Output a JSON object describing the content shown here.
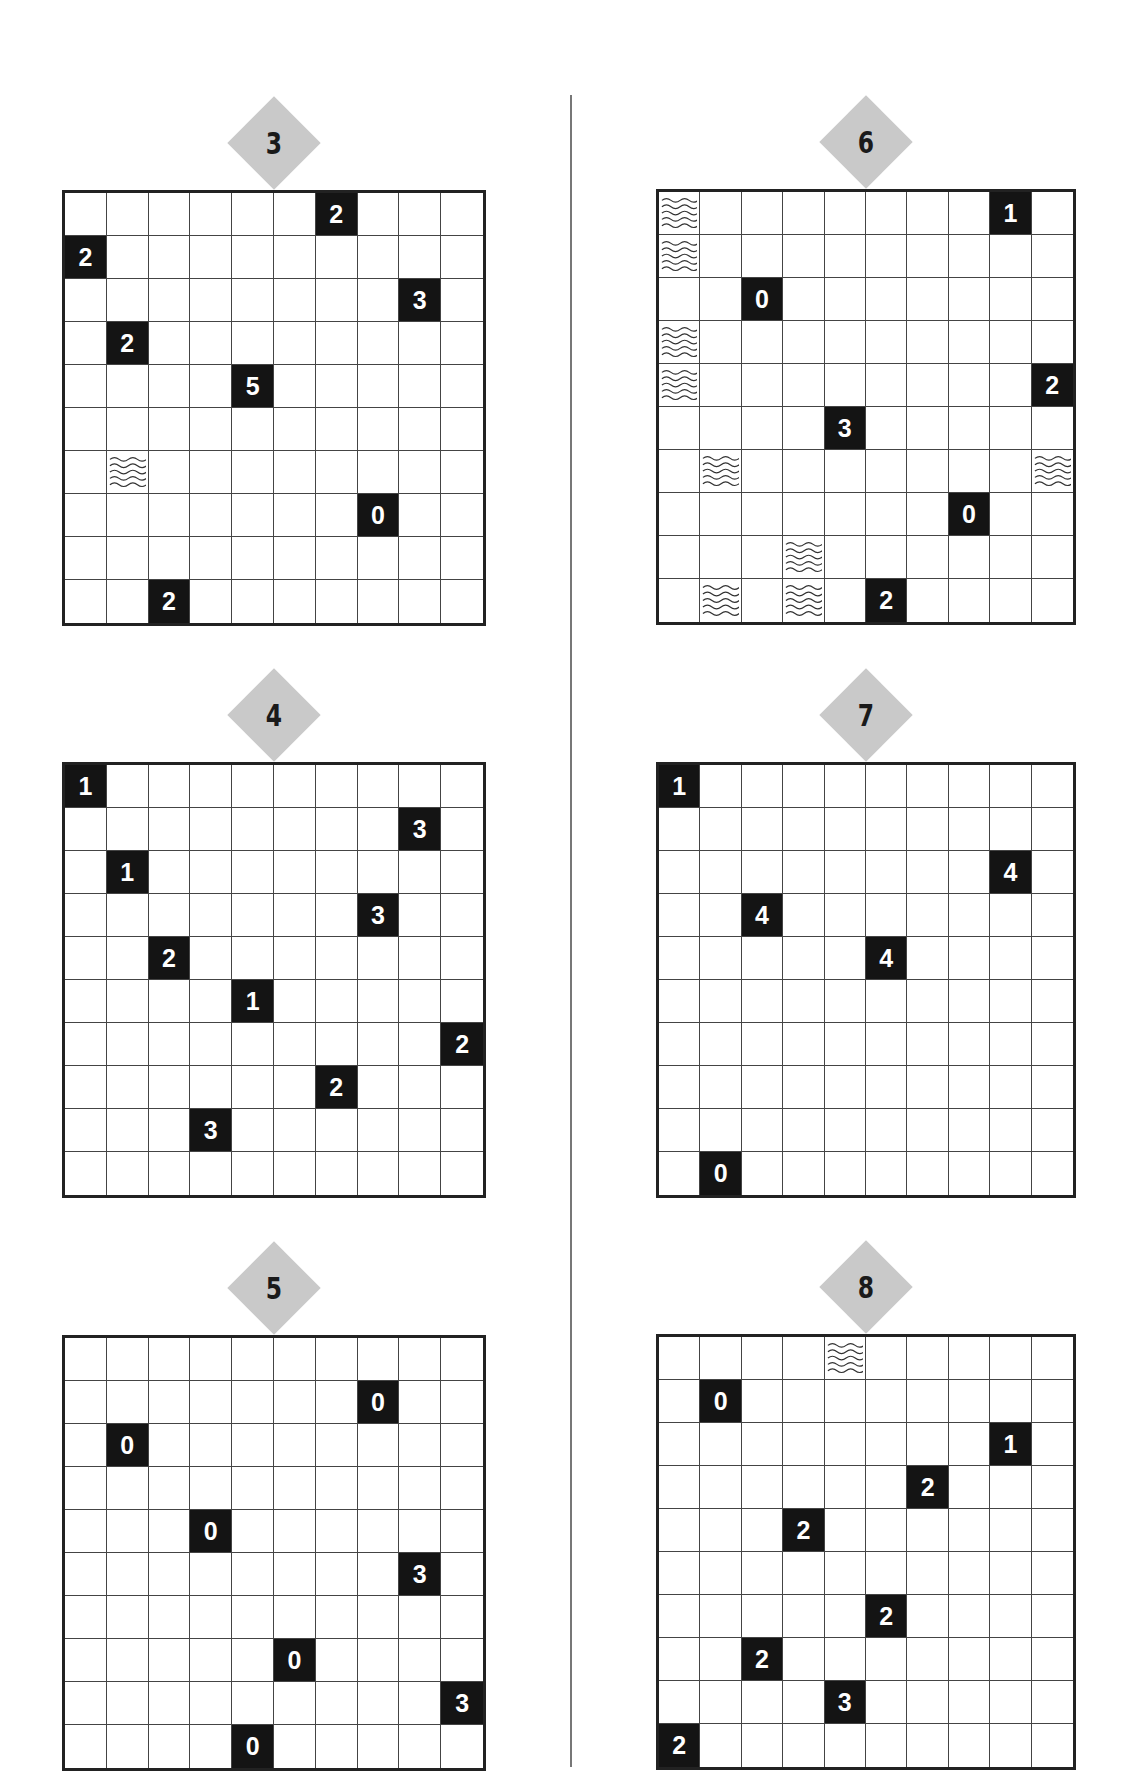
{
  "page": {
    "divider": true
  },
  "puzzles": [
    {
      "label": "3",
      "column": "left",
      "grid_x": 62,
      "grid_y": 190,
      "rows": 10,
      "cols": 10,
      "clues": [
        {
          "r": 0,
          "c": 6,
          "v": "2"
        },
        {
          "r": 1,
          "c": 0,
          "v": "2"
        },
        {
          "r": 2,
          "c": 8,
          "v": "3"
        },
        {
          "r": 3,
          "c": 1,
          "v": "2"
        },
        {
          "r": 4,
          "c": 4,
          "v": "5"
        },
        {
          "r": 7,
          "c": 7,
          "v": "0"
        },
        {
          "r": 9,
          "c": 2,
          "v": "2"
        }
      ],
      "water": [
        {
          "r": 6,
          "c": 1
        }
      ]
    },
    {
      "label": "4",
      "column": "left",
      "grid_x": 62,
      "grid_y": 762,
      "rows": 10,
      "cols": 10,
      "clues": [
        {
          "r": 0,
          "c": 0,
          "v": "1"
        },
        {
          "r": 1,
          "c": 8,
          "v": "3"
        },
        {
          "r": 2,
          "c": 1,
          "v": "1"
        },
        {
          "r": 3,
          "c": 7,
          "v": "3"
        },
        {
          "r": 4,
          "c": 2,
          "v": "2"
        },
        {
          "r": 5,
          "c": 4,
          "v": "1"
        },
        {
          "r": 6,
          "c": 9,
          "v": "2"
        },
        {
          "r": 7,
          "c": 6,
          "v": "2"
        },
        {
          "r": 8,
          "c": 3,
          "v": "3"
        }
      ],
      "water": []
    },
    {
      "label": "5",
      "column": "left",
      "grid_x": 62,
      "grid_y": 1335,
      "rows": 10,
      "cols": 10,
      "clues": [
        {
          "r": 1,
          "c": 7,
          "v": "0"
        },
        {
          "r": 2,
          "c": 1,
          "v": "0"
        },
        {
          "r": 4,
          "c": 3,
          "v": "0"
        },
        {
          "r": 5,
          "c": 8,
          "v": "3"
        },
        {
          "r": 7,
          "c": 5,
          "v": "0"
        },
        {
          "r": 8,
          "c": 9,
          "v": "3"
        },
        {
          "r": 9,
          "c": 4,
          "v": "0"
        }
      ],
      "water": []
    },
    {
      "label": "6",
      "column": "right",
      "grid_x": 656,
      "grid_y": 189,
      "rows": 10,
      "cols": 10,
      "clues": [
        {
          "r": 0,
          "c": 8,
          "v": "1"
        },
        {
          "r": 2,
          "c": 2,
          "v": "0"
        },
        {
          "r": 4,
          "c": 9,
          "v": "2"
        },
        {
          "r": 5,
          "c": 4,
          "v": "3"
        },
        {
          "r": 7,
          "c": 7,
          "v": "0"
        },
        {
          "r": 9,
          "c": 5,
          "v": "2"
        }
      ],
      "water": [
        {
          "r": 0,
          "c": 0
        },
        {
          "r": 1,
          "c": 0
        },
        {
          "r": 3,
          "c": 0
        },
        {
          "r": 4,
          "c": 0
        },
        {
          "r": 6,
          "c": 1
        },
        {
          "r": 6,
          "c": 9
        },
        {
          "r": 8,
          "c": 3
        },
        {
          "r": 9,
          "c": 1
        },
        {
          "r": 9,
          "c": 3
        }
      ]
    },
    {
      "label": "7",
      "column": "right",
      "grid_x": 656,
      "grid_y": 762,
      "rows": 10,
      "cols": 10,
      "clues": [
        {
          "r": 0,
          "c": 0,
          "v": "1"
        },
        {
          "r": 2,
          "c": 8,
          "v": "4"
        },
        {
          "r": 3,
          "c": 2,
          "v": "4"
        },
        {
          "r": 4,
          "c": 5,
          "v": "4"
        },
        {
          "r": 9,
          "c": 1,
          "v": "0"
        }
      ],
      "water": []
    },
    {
      "label": "8",
      "column": "right",
      "grid_x": 656,
      "grid_y": 1334,
      "rows": 10,
      "cols": 10,
      "clues": [
        {
          "r": 1,
          "c": 1,
          "v": "0"
        },
        {
          "r": 2,
          "c": 8,
          "v": "1"
        },
        {
          "r": 3,
          "c": 6,
          "v": "2"
        },
        {
          "r": 4,
          "c": 3,
          "v": "2"
        },
        {
          "r": 6,
          "c": 5,
          "v": "2"
        },
        {
          "r": 7,
          "c": 2,
          "v": "2"
        },
        {
          "r": 8,
          "c": 4,
          "v": "3"
        },
        {
          "r": 9,
          "c": 0,
          "v": "2"
        }
      ],
      "water": [
        {
          "r": 0,
          "c": 4
        }
      ]
    }
  ],
  "colors": {
    "badge": "#c9c9c9",
    "clue_cell": "#141414",
    "grid_line": "#444444",
    "divider": "#777777"
  },
  "icons": {
    "water": "wave-icon"
  }
}
